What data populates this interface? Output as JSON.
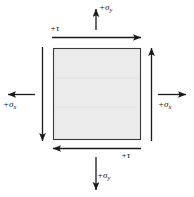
{
  "figure": {
    "element": {
      "shape": "square",
      "fill_color": "#ebebeb",
      "stroke_color": "#3a3a3a"
    },
    "labels": {
      "sigma_y_top": {
        "sign": "+",
        "symbol": "σ",
        "subscript": "y"
      },
      "sigma_y_bottom": {
        "sign": "+",
        "symbol": "σ",
        "subscript": "y"
      },
      "sigma_x_left": {
        "sign": "+",
        "symbol": "σ",
        "subscript": "x"
      },
      "sigma_x_right": {
        "sign": "+",
        "symbol": "σ",
        "subscript": "x"
      },
      "tau_top": {
        "sign": "+",
        "symbol": "τ",
        "subscript": ""
      },
      "tau_bottom": {
        "sign": "+",
        "symbol": "τ",
        "subscript": ""
      }
    },
    "label_text": {
      "sigma_y_top": "+σ",
      "sigma_y_bottom": "+σ",
      "sigma_x_left": "+σ",
      "sigma_x_right": "+σ",
      "tau_top": "+τ",
      "tau_bottom": "+τ"
    },
    "subscripts": {
      "y_top": "y",
      "y_bottom": "y",
      "x_left": "x",
      "x_right": "x"
    },
    "arrows": [
      {
        "name": "sigma-y-top-arrow",
        "direction": "up",
        "type": "normal-stress"
      },
      {
        "name": "sigma-y-bottom-arrow",
        "direction": "down",
        "type": "normal-stress"
      },
      {
        "name": "sigma-x-left-arrow",
        "direction": "left",
        "type": "normal-stress"
      },
      {
        "name": "sigma-x-right-arrow",
        "direction": "right",
        "type": "normal-stress"
      },
      {
        "name": "tau-top-arrow",
        "direction": "right",
        "type": "shear-stress"
      },
      {
        "name": "tau-bottom-arrow",
        "direction": "left",
        "type": "shear-stress"
      },
      {
        "name": "tau-left-arrow",
        "direction": "down",
        "type": "shear-stress"
      },
      {
        "name": "tau-right-arrow",
        "direction": "up",
        "type": "shear-stress"
      }
    ],
    "colors": {
      "line": "#1a1a1a",
      "element_fill": "#ebebeb",
      "element_stroke": "#3a3a3a",
      "background": "#ffffff"
    }
  }
}
